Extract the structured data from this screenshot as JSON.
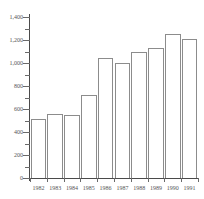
{
  "chart_data": {
    "type": "bar",
    "title": "",
    "subtitle": "",
    "xlabel": "",
    "ylabel": "",
    "categories": [
      "1982",
      "1983",
      "1984",
      "1985",
      "1986",
      "1987",
      "1988",
      "1989",
      "1990",
      "1991"
    ],
    "values": [
      510,
      555,
      545,
      720,
      1040,
      1000,
      1100,
      1130,
      1250,
      1210
    ],
    "series": [
      {
        "name": "",
        "values": [
          510,
          555,
          545,
          720,
          1040,
          1000,
          1100,
          1130,
          1250,
          1210
        ]
      }
    ],
    "ylim": [
      0,
      1400
    ],
    "ytick_values": [
      0,
      200,
      400,
      600,
      800,
      1000,
      1200,
      1400
    ],
    "ytick_labels": [
      "0",
      "200",
      "400",
      "600",
      "800",
      "1,000",
      "1,200",
      "1,400"
    ],
    "yminor_tick_values": [
      100,
      300,
      500,
      700,
      900,
      1100,
      1300
    ],
    "grid": false,
    "legend": false,
    "legend_position": "none",
    "bar_fill_color": "#ffffff",
    "bar_edge_color": "#8c8c8c",
    "axis_color": "#4a4a4a",
    "text_color": "#555555",
    "background_color": "#ffffff",
    "annotations": []
  }
}
